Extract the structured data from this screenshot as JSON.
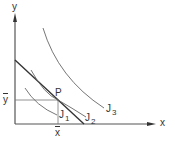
{
  "diagram": {
    "axes": {
      "x_label": "x",
      "y_label": "y"
    },
    "point": {
      "label": "P",
      "x_label": "x",
      "y_label": "y"
    },
    "curves": [
      {
        "name": "J",
        "sub": "1"
      },
      {
        "name": "J",
        "sub": "2"
      },
      {
        "name": "J",
        "sub": "3"
      }
    ],
    "colors": {
      "line": "#555555",
      "tangent": "#333333",
      "text": "#333333"
    }
  }
}
